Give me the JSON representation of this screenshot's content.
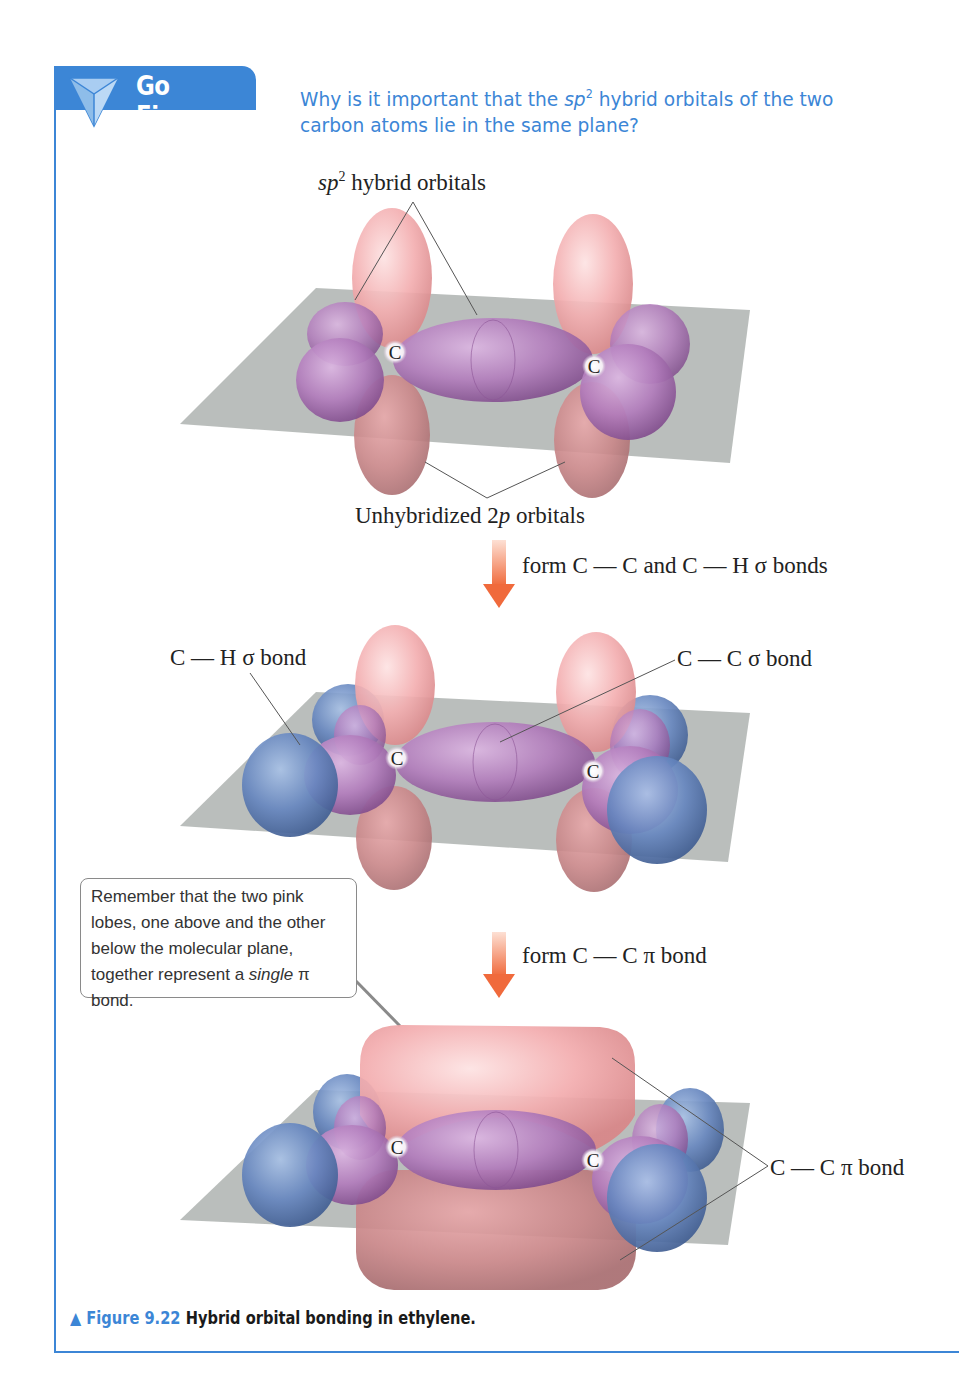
{
  "header": {
    "badge_label": "Go Figure",
    "badge_icon": "triangle-prism-icon",
    "question_part1": "Why is it important that the ",
    "question_sp": "sp",
    "question_sup": "2",
    "question_part2": " hybrid orbitals of the two carbon atoms lie in the same plane?"
  },
  "diagram1": {
    "label_top_sp": "sp",
    "label_top_sup": "2",
    "label_top_rest": " hybrid orbitals",
    "label_bottom_prefix": "Unhybridized 2",
    "label_bottom_p": "p",
    "label_bottom_suffix": " orbitals",
    "atom_left": "C",
    "atom_right": "C"
  },
  "step1": {
    "arrow_icon": "down-arrow-icon",
    "text": "form C — C and C — H σ bonds"
  },
  "diagram2": {
    "label_ch": "C — H σ bond",
    "label_cc": "C — C σ bond",
    "atom_left": "C",
    "atom_right": "C"
  },
  "callout": {
    "line1": "Remember that the two pink lobes, one above and the other below the molecular plane, together represent a ",
    "italic": "single",
    "line2": " π bond."
  },
  "step2": {
    "arrow_icon": "down-arrow-icon",
    "text": "form C — C π bond"
  },
  "diagram3": {
    "label_pi": "C — C π bond",
    "atom_left": "C",
    "atom_right": "C"
  },
  "caption": {
    "marker": "▲",
    "figure_number": "Figure 9.22",
    "description": "Hybrid orbital bonding in ethylene."
  },
  "colors": {
    "accent_blue": "#3c86d6",
    "p_orbital_pink": "#f2a8aa",
    "sp2_purple": "#a86bb4",
    "hydrogen_blue": "#5a7fb8",
    "plane_gray": "#a9aeaa",
    "arrow_orange": "#f0744a"
  }
}
